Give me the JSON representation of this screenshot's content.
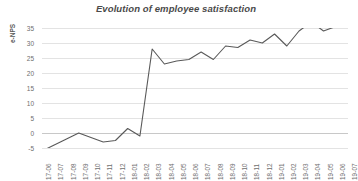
{
  "chart_data": {
    "type": "line",
    "title": "Evolution of employee satisfaction",
    "xlabel": "",
    "ylabel": "e-NPS",
    "ylim": [
      -5,
      35
    ],
    "ytick_values": [
      35,
      30,
      25,
      20,
      15,
      10,
      5,
      0,
      -5
    ],
    "ytick_labels": [
      "35",
      "30",
      "25",
      "20",
      "15",
      "10",
      "5",
      "0",
      "-5"
    ],
    "grid": "horizontal",
    "legend": "none",
    "line_color": "#595959",
    "grid_color": "#e3e3e3",
    "text_color": "#6e6e6e",
    "title_color": "#4a4a4a",
    "categories": [
      "17-06",
      "17-07",
      "17-08",
      "17-09",
      "17-10",
      "17-11",
      "17-12",
      "18-01",
      "18-02",
      "18-03",
      "18-04",
      "18-05",
      "18-06",
      "18-07",
      "18-08",
      "18-09",
      "18-10",
      "18-11",
      "18-12",
      "19-01",
      "19-02",
      "19-03",
      "19-04",
      "19-05",
      "19-06",
      "19-07"
    ],
    "values": [
      -6,
      -4,
      -2,
      0,
      -1.5,
      -3,
      -2.5,
      1.5,
      -1,
      28,
      23,
      24,
      24.5,
      27,
      24.5,
      29,
      28.5,
      31,
      30,
      33,
      29,
      34,
      37,
      34,
      35.5,
      37
    ]
  }
}
